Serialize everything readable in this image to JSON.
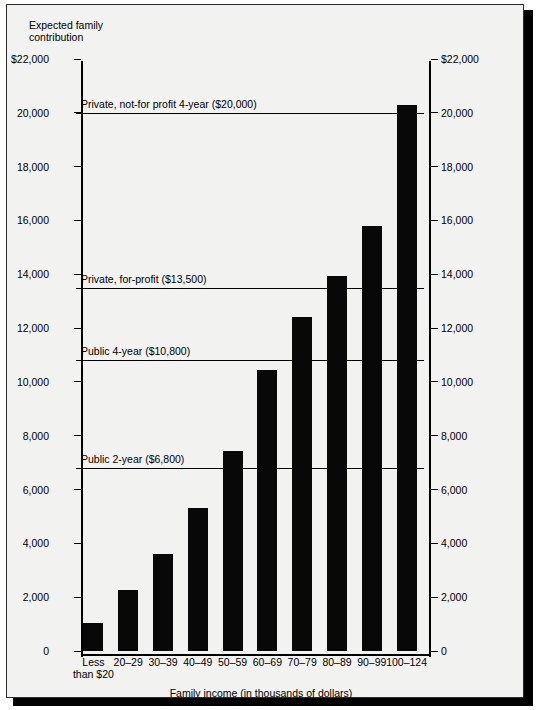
{
  "chart_data": {
    "type": "bar",
    "title": "",
    "ylabel": "Expected family\ncontribution",
    "xlabel": "Family income (in thousands of dollars)",
    "categories": [
      "Less\nthan $20",
      "20–29",
      "30–39",
      "40–49",
      "50–59",
      "60–69",
      "70–79",
      "80–89",
      "90–99",
      "100–124"
    ],
    "values": [
      1050,
      2250,
      3600,
      5300,
      7450,
      10450,
      12400,
      13950,
      15800,
      20300
    ],
    "ylim": [
      0,
      22000
    ],
    "y_ticks": [
      0,
      2000,
      4000,
      6000,
      8000,
      10000,
      12000,
      14000,
      16000,
      18000,
      20000,
      22000
    ],
    "y_tick_labels_left": [
      "0",
      "2,000",
      "4,000",
      "6,000",
      "8,000",
      "10,000",
      "12,000",
      "14,000",
      "16,000",
      "18,000",
      "20,000",
      "$22,000"
    ],
    "y_tick_labels_right": [
      "0",
      "2,000",
      "4,000",
      "6,000",
      "8,000",
      "10,000",
      "12,000",
      "14,000",
      "16,000",
      "18,000",
      "20,000",
      "$22,000"
    ],
    "grid": false,
    "legend": "none",
    "bar_color": "#080808",
    "reference_lines": [
      {
        "label": "Private, not-for profit 4-year ($20,000)",
        "value": 20000
      },
      {
        "label": "Private, for-profit ($13,500)",
        "value": 13500
      },
      {
        "label": "Public 4-year ($10,800)",
        "value": 10800
      },
      {
        "label": "Public 2-year ($6,800)",
        "value": 6800
      }
    ]
  },
  "axes": {
    "y_title": "Expected family\ncontribution",
    "x_title": "Family income (in thousands of dollars)"
  }
}
